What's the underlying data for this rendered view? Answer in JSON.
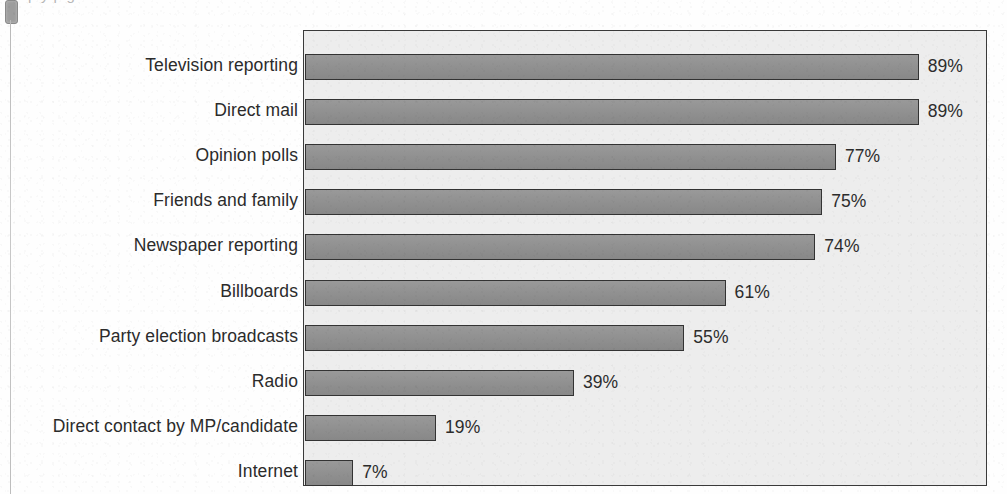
{
  "page": {
    "margin_marker": "page-marker",
    "caption_fragment": "p y p g",
    "background_color": "#fefefe"
  },
  "chart": {
    "frame_color": "#3a3a3a",
    "plot_background": "#ededed",
    "bar_fill": "#8f8f8f",
    "bar_border": "#333333",
    "label_color": "#2b2b2b",
    "value_suffix": "%"
  },
  "chart_data": {
    "type": "bar",
    "orientation": "horizontal",
    "title": "",
    "xlabel": "",
    "ylabel": "",
    "xlim": [
      0,
      100
    ],
    "grid": false,
    "legend": false,
    "categories": [
      "Television reporting",
      "Direct mail",
      "Opinion polls",
      "Friends and family",
      "Newspaper reporting",
      "Billboards",
      "Party election broadcasts",
      "Radio",
      "Direct contact by MP/candidate",
      "Internet"
    ],
    "values": [
      89,
      89,
      77,
      75,
      74,
      61,
      55,
      39,
      19,
      7
    ],
    "data_labels": [
      "89%",
      "89%",
      "77%",
      "75%",
      "74%",
      "61%",
      "55%",
      "39%",
      "19%",
      "7%"
    ]
  }
}
